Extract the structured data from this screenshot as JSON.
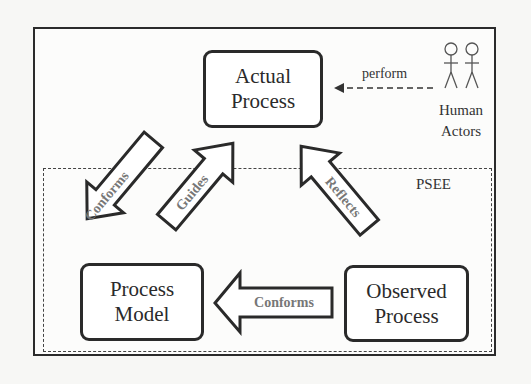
{
  "diagram": {
    "nodes": {
      "actual_process": {
        "line1": "Actual",
        "line2": "Process"
      },
      "process_model": {
        "line1": "Process",
        "line2": "Model"
      },
      "observed_process": {
        "line1": "Observed",
        "line2": "Process"
      }
    },
    "actors": {
      "line1": "Human",
      "line2": "Actors",
      "icon": "stick-figure-icon",
      "count": 2
    },
    "boundary_label": "PSEE",
    "edges": {
      "perform": "perform",
      "conforms_model_to_actual": "Conforms",
      "guides": "Guides",
      "reflects": "Reflects",
      "conforms_observed_to_model": "Conforms"
    },
    "colors": {
      "stroke": "#2a2a2a",
      "arrow_text": "#777777",
      "background": "#fcfcfb"
    }
  }
}
